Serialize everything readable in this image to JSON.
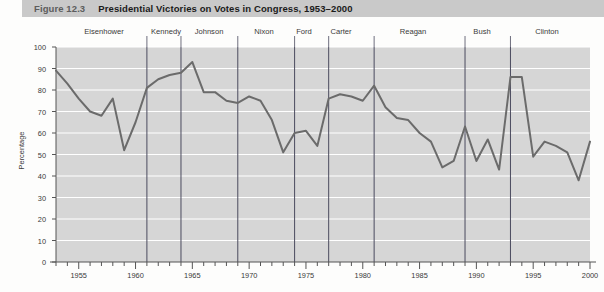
{
  "figure": {
    "number": "Figure 12.3",
    "title": "Presidential Victories on Votes in Congress, 1953–2000"
  },
  "presidents": [
    {
      "name": "Eisenhower",
      "label_x": 104,
      "start_x": 56,
      "end_x": 150
    },
    {
      "name": "Kennedy",
      "label_x": 166,
      "start_x": 150,
      "end_x": 183
    },
    {
      "name": "Johnson",
      "label_x": 209,
      "start_x": 183,
      "end_x": 237
    },
    {
      "name": "Nixon",
      "label_x": 264,
      "start_x": 237,
      "end_x": 292
    },
    {
      "name": "Ford",
      "label_x": 304,
      "start_x": 292,
      "end_x": 317
    },
    {
      "name": "Carter",
      "label_x": 341,
      "start_x": 317,
      "end_x": 366
    },
    {
      "name": "Reagan",
      "label_x": 413,
      "start_x": 366,
      "end_x": 460
    },
    {
      "name": "Bush",
      "label_x": 482,
      "start_x": 460,
      "end_x": 505
    },
    {
      "name": "Clinton",
      "label_x": 547,
      "start_x": 505,
      "end_x": 590
    }
  ],
  "divider_years": [
    1961,
    1964,
    1969,
    1974,
    1977,
    1981,
    1989,
    1993
  ],
  "chart_data": {
    "type": "line",
    "title": "Presidential Victories on Votes in Congress, 1953–2000",
    "xlabel": "",
    "ylabel": "Percentage",
    "xlim": [
      1953,
      2000
    ],
    "ylim": [
      0,
      100
    ],
    "grid": true,
    "legend": false,
    "y_ticks": [
      0,
      10,
      20,
      30,
      40,
      50,
      60,
      70,
      80,
      90,
      100
    ],
    "x_ticks_labeled": [
      1955,
      1960,
      1965,
      1970,
      1975,
      1980,
      1985,
      1990,
      1995,
      2000
    ],
    "x_tick_interval_minor": 1,
    "line_color": "#6b6b6b",
    "plot_background": "#d6d6d6",
    "gridline_color": "#ffffff",
    "series": [
      {
        "name": "Presidential victories",
        "x": [
          1953,
          1954,
          1955,
          1956,
          1957,
          1958,
          1959,
          1960,
          1961,
          1962,
          1963,
          1964,
          1965,
          1966,
          1967,
          1968,
          1969,
          1970,
          1971,
          1972,
          1973,
          1974,
          1975,
          1976,
          1977,
          1978,
          1979,
          1980,
          1981,
          1982,
          1983,
          1984,
          1985,
          1986,
          1987,
          1988,
          1989,
          1990,
          1991,
          1992,
          1993,
          1994,
          1995,
          1996,
          1997,
          1998,
          1999,
          2000
        ],
        "values": [
          89,
          83,
          76,
          70,
          68,
          76,
          52,
          65,
          81,
          85,
          87,
          88,
          93,
          79,
          79,
          75,
          74,
          77,
          75,
          66,
          51,
          60,
          61,
          54,
          76,
          78,
          77,
          75,
          82,
          72,
          67,
          66,
          60,
          56,
          44,
          47,
          63,
          47,
          57,
          43,
          86,
          86,
          49,
          56,
          54,
          51,
          38,
          56
        ]
      }
    ]
  }
}
